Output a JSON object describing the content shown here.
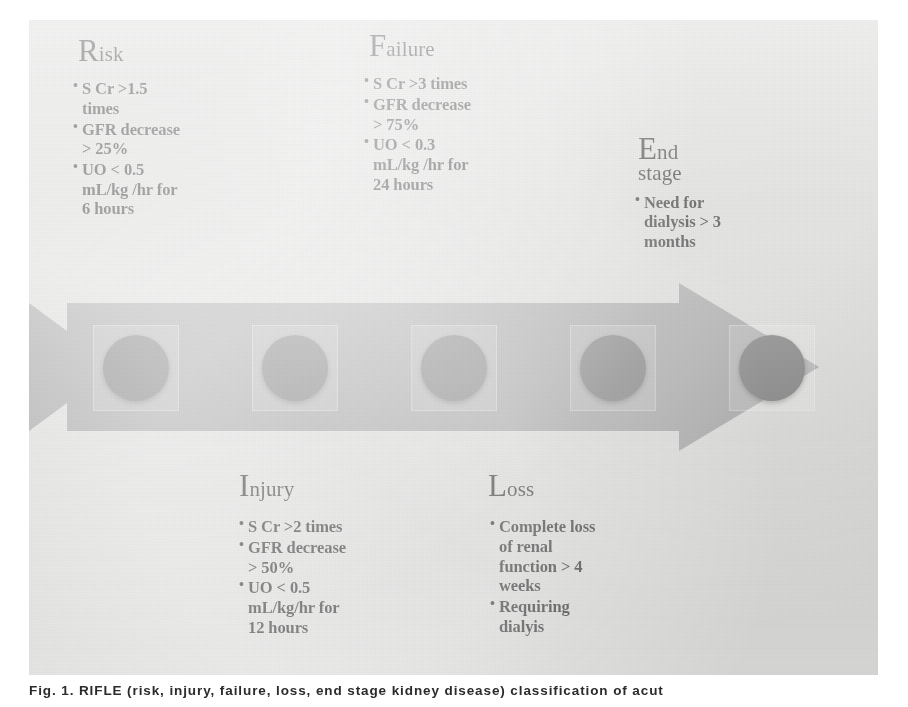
{
  "figure": {
    "kind": "rifle-criteria-arrow-diagram",
    "caption": "Fig. 1.  RIFLE (risk, injury, failure, loss, end stage kidney disease) classification of acut",
    "colors": {
      "panel_background": "#d9d9d7",
      "arrow_fill": "#9b9b9b",
      "marker_dot": "#6e6e6e",
      "marker_plate": "#e3e3e1",
      "text": "#1b1b1b",
      "caption_text": "#2b2b2b"
    },
    "marker_count": 5,
    "arrow_direction": "right"
  },
  "stages": [
    {
      "id": "risk",
      "cap": "R",
      "rest": "isk",
      "word2": "",
      "placement": "above",
      "bullets": [
        "S Cr >1.5 times",
        "GFR decrease > 25%",
        "UO < 0.5 mL/kg /hr for 6 hours"
      ]
    },
    {
      "id": "injury",
      "cap": "I",
      "rest": "njury",
      "word2": "",
      "placement": "below",
      "bullets": [
        "S Cr >2 times",
        "GFR decrease > 50%",
        "UO < 0.5 mL/kg/hr for 12 hours"
      ]
    },
    {
      "id": "failure",
      "cap": "F",
      "rest": "ailure",
      "word2": "",
      "placement": "above",
      "bullets": [
        "S Cr >3 times",
        "GFR decrease > 75%",
        "UO < 0.3 mL/kg /hr for 24 hours"
      ]
    },
    {
      "id": "loss",
      "cap": "L",
      "rest": "oss",
      "word2": "",
      "placement": "below",
      "bullets": [
        "Complete loss of renal function > 4 weeks",
        "Requiring dialyis"
      ]
    },
    {
      "id": "end-stage",
      "cap": "E",
      "rest": "nd",
      "word2": "stage",
      "placement": "above",
      "bullets": [
        "Need for dialysis > 3 months"
      ]
    }
  ]
}
